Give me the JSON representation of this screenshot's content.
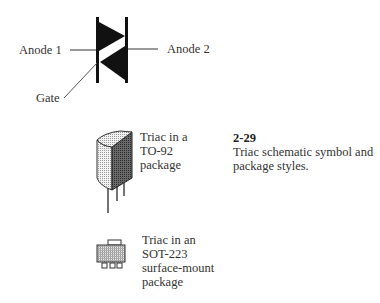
{
  "symbol": {
    "title": "Triac schematic symbol",
    "labels": {
      "anode1": "Anode 1",
      "anode2": "Anode 2",
      "gate": "Gate"
    }
  },
  "packages": [
    {
      "id": "to92",
      "lines": [
        "Triac in a",
        "TO-92",
        "package"
      ]
    },
    {
      "id": "sot223",
      "lines": [
        "Triac in an",
        "SOT-223",
        "surface-mount",
        "package"
      ]
    }
  ],
  "caption": {
    "number": "2-29",
    "lines": [
      "Triac schematic symbol and",
      "package styles."
    ]
  },
  "colors": {
    "ink": "#111111",
    "lead": "#555555",
    "body_light": "#d8d8d8",
    "body_dark": "#555555"
  }
}
